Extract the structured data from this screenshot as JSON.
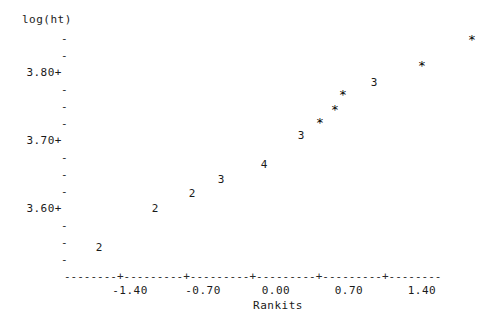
{
  "plot": {
    "ytitle": "log(ht)",
    "xtitle": "Rankits",
    "axis_rule": "--------+---------+---------+---------+---------+--------",
    "y_labels": [
      {
        "text": "3.80+",
        "value": 3.8,
        "y": 66
      },
      {
        "text": "3.70+",
        "value": 3.7,
        "y": 134
      },
      {
        "text": "3.60+",
        "value": 3.6,
        "y": 202
      }
    ],
    "y_minor_ticks": [
      {
        "text": "-",
        "y": 32
      },
      {
        "text": "-",
        "y": 49
      },
      {
        "text": "-",
        "y": 83
      },
      {
        "text": "-",
        "y": 100
      },
      {
        "text": "-",
        "y": 117
      },
      {
        "text": "-",
        "y": 151
      },
      {
        "text": "-",
        "y": 168
      },
      {
        "text": "-",
        "y": 185
      },
      {
        "text": "-",
        "y": 219
      },
      {
        "text": "-",
        "y": 236
      },
      {
        "text": "-",
        "y": 253
      }
    ],
    "x_labels": [
      {
        "text": "-1.40",
        "value": -1.4,
        "x": 100
      },
      {
        "text": "-0.70",
        "value": -0.7,
        "x": 173
      },
      {
        "text": "0.00",
        "value": 0.0,
        "x": 246
      },
      {
        "text": "0.70",
        "value": 0.7,
        "x": 319
      },
      {
        "text": "1.40",
        "value": 1.4,
        "x": 392
      }
    ]
  },
  "chart_data": {
    "type": "scatter",
    "title": "",
    "xlabel": "Rankits",
    "ylabel": "log(ht)",
    "xlim": [
      -1.85,
      1.85
    ],
    "ylim": [
      3.555,
      3.875
    ],
    "grid": false,
    "legend": null,
    "note": "Minitab-style character normal probability plot; digits denote the number of coincident observations at that location, '*' denotes a single observation.",
    "points": [
      {
        "symbol": "2",
        "count": 2,
        "x": -1.7,
        "y": 3.575,
        "px": 99,
        "py": 242
      },
      {
        "symbol": "2",
        "count": 2,
        "x": -1.14,
        "y": 3.634,
        "px": 155,
        "py": 203
      },
      {
        "symbol": "2",
        "count": 2,
        "x": -0.77,
        "y": 3.656,
        "px": 192,
        "py": 188
      },
      {
        "symbol": "3",
        "count": 3,
        "x": -0.48,
        "y": 3.677,
        "px": 221,
        "py": 174
      },
      {
        "symbol": "4",
        "count": 4,
        "x": -0.06,
        "y": 3.699,
        "px": 264,
        "py": 159
      },
      {
        "symbol": "3",
        "count": 3,
        "x": 0.31,
        "y": 3.742,
        "px": 301,
        "py": 130
      },
      {
        "symbol": "*",
        "count": 1,
        "x": 0.5,
        "y": 3.762,
        "px": 320,
        "py": 117
      },
      {
        "symbol": "*",
        "count": 1,
        "x": 0.65,
        "y": 3.781,
        "px": 335,
        "py": 104
      },
      {
        "symbol": "*",
        "count": 1,
        "x": 0.73,
        "y": 3.804,
        "px": 343,
        "py": 89
      },
      {
        "symbol": "3",
        "count": 3,
        "x": 1.04,
        "y": 3.822,
        "px": 374,
        "py": 77
      },
      {
        "symbol": "*",
        "count": 1,
        "x": 1.5,
        "y": 3.845,
        "px": 422,
        "py": 60
      },
      {
        "symbol": "*",
        "count": 1,
        "x": 1.98,
        "y": 3.883,
        "px": 472,
        "py": 34
      }
    ]
  }
}
